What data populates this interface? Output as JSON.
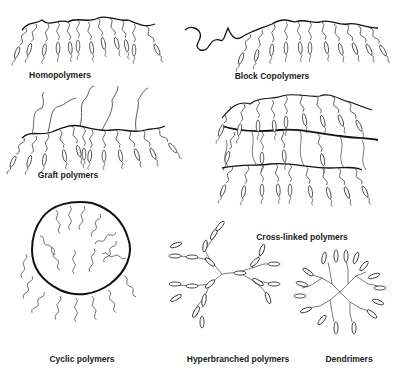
{
  "figure": {
    "type": "polymer-architecture-diagram",
    "background": "#ffffff",
    "line_color": "#1a1a1a",
    "panels": [
      {
        "id": "homopolymers",
        "label": "Homopolymers",
        "label_pos": [
          60,
          76
        ]
      },
      {
        "id": "block-copolymers",
        "label": "Block Copolymers",
        "label_pos": [
          270,
          77
        ]
      },
      {
        "id": "graft-polymers",
        "label": "Graft polymers",
        "label_pos": [
          70,
          177
        ]
      },
      {
        "id": "cross-linked-polymers",
        "label": "Cross-linked polymers",
        "label_pos": [
          300,
          237
        ]
      },
      {
        "id": "cyclic-polymers",
        "label": "Cyclic polymers",
        "label_pos": [
          83,
          360
        ]
      },
      {
        "id": "hyperbranched-polymers",
        "label": "Hyperbranched polymers",
        "label_pos": [
          239,
          360
        ]
      },
      {
        "id": "dendrimers",
        "label": "Dendrimers",
        "label_pos": [
          349,
          360
        ]
      }
    ]
  }
}
